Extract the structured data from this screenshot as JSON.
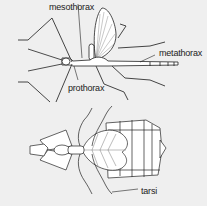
{
  "diagram": {
    "colors": {
      "background": "#efefef",
      "stroke": "#222222",
      "fill": "#ffffff",
      "leg": "#555555"
    },
    "figures": [
      {
        "name": "stick-insect",
        "labels": [
          {
            "text": "mesothorax",
            "x": 49,
            "y": 2
          },
          {
            "text": "metathorax",
            "x": 159,
            "y": 48
          },
          {
            "text": "prothorax",
            "x": 68,
            "y": 83
          }
        ]
      },
      {
        "name": "leaf-insect",
        "labels": [
          {
            "text": "tarsi",
            "x": 141,
            "y": 187
          }
        ]
      }
    ]
  }
}
